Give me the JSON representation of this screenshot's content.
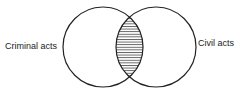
{
  "diagram": {
    "type": "venn",
    "sets": [
      {
        "label": "Criminal acts",
        "cx": 103,
        "cy": 47,
        "r": 40
      },
      {
        "label": "Civil acts",
        "cx": 156,
        "cy": 47,
        "r": 40
      }
    ],
    "intersection": {
      "fill": "horizontal-hatch"
    },
    "colors": {
      "stroke": "#222222",
      "background": "#ffffff"
    }
  }
}
